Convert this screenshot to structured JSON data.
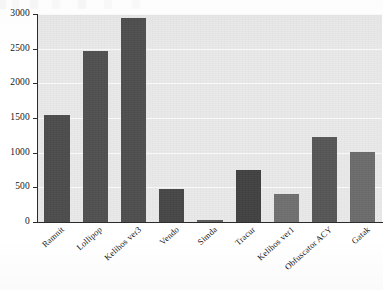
{
  "chart_data": {
    "type": "bar",
    "title": "",
    "xlabel": "",
    "ylabel": "",
    "categories": [
      "Ramnit",
      "Lollipop",
      "Kelihos ver3",
      "Vendo",
      "Simda",
      "Tracur",
      "Kelihos ver1",
      "Obfuscator ACY",
      "Gatak"
    ],
    "values": [
      1540,
      2460,
      2940,
      470,
      30,
      750,
      400,
      1230,
      1010
    ],
    "ylim": [
      0,
      3000
    ],
    "yticks": [
      0,
      500,
      1000,
      1500,
      2000,
      2500,
      3000
    ],
    "ytick_labels": [
      "0",
      "500",
      "1000",
      "1500",
      "2000",
      "2500",
      "3000"
    ],
    "grid": true,
    "grid_axis": "y",
    "legend": false,
    "bar_color": "#4f4f4f",
    "plot_background": "#e9e9e9",
    "figure_background": "#ffffff",
    "gridline_color": "#fbfbfb",
    "axis_color": "#2c2c2c",
    "xtick_label_rotation": -42
  }
}
